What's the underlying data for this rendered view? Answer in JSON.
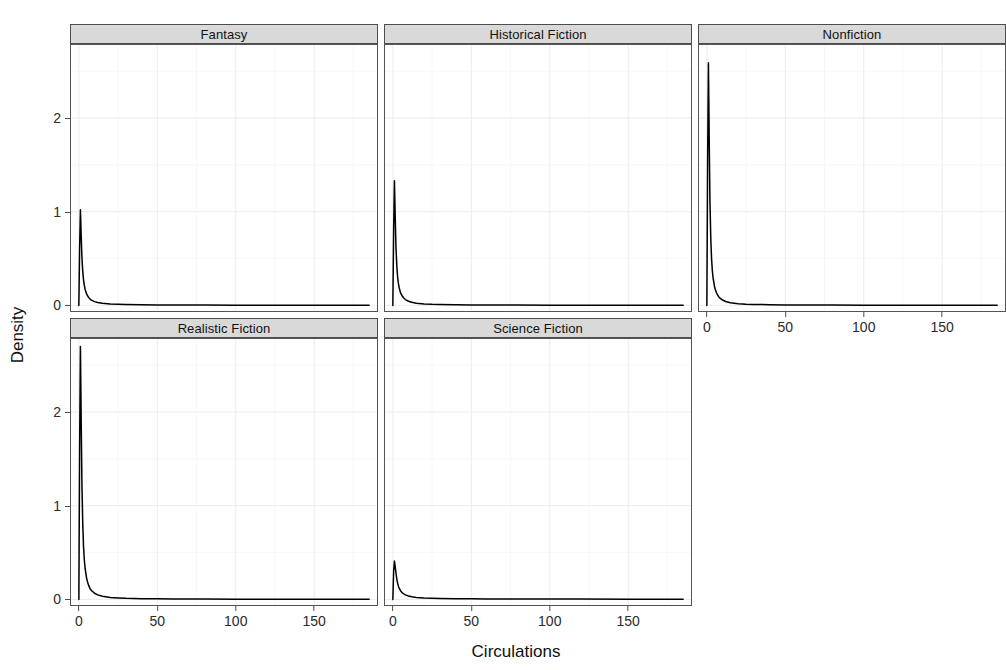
{
  "chart_data": {
    "type": "line",
    "title": "",
    "subtitle": "",
    "xlabel": "Circulations",
    "ylabel": "Density",
    "plot_kind": "faceted density plot",
    "facet_variable": "genre",
    "grid": true,
    "legend": "none",
    "xlim": [
      -5,
      190
    ],
    "ylim": [
      -0.06,
      2.78
    ],
    "x_ticks": [
      0,
      50,
      100,
      150
    ],
    "x_tick_labels": [
      "0",
      "50",
      "100",
      "150"
    ],
    "y_ticks": [
      0,
      1,
      2
    ],
    "y_tick_labels": [
      "0",
      "1",
      "2"
    ],
    "line_color": "#000000",
    "panel_background": "#ffffff",
    "strip_background": "#d9d9d9",
    "gridline_color": "#ebebeb",
    "panels": [
      {
        "label": "Fantasy",
        "row": 0,
        "col": 0,
        "peak_x": 1.0,
        "peak_density": 1.02,
        "x": [
          0,
          0.5,
          1,
          1.5,
          2,
          2.5,
          3,
          3.5,
          4,
          5,
          6,
          7,
          8,
          10,
          12,
          15,
          20,
          25,
          30,
          40,
          50,
          60,
          80,
          100,
          120,
          150,
          185
        ],
        "y": [
          0.0,
          0.62,
          1.02,
          0.74,
          0.5,
          0.36,
          0.27,
          0.21,
          0.17,
          0.12,
          0.09,
          0.07,
          0.056,
          0.04,
          0.03,
          0.022,
          0.014,
          0.011,
          0.009,
          0.007,
          0.005,
          0.004,
          0.003,
          0.002,
          0.002,
          0.001,
          0.001
        ]
      },
      {
        "label": "Historical Fiction",
        "row": 0,
        "col": 1,
        "peak_x": 1.0,
        "peak_density": 1.33,
        "x": [
          0,
          0.5,
          1,
          1.5,
          2,
          2.5,
          3,
          3.5,
          4,
          5,
          6,
          7,
          8,
          10,
          12,
          15,
          20,
          25,
          30,
          40,
          50,
          60,
          80,
          100,
          120,
          150,
          185
        ],
        "y": [
          0.0,
          0.8,
          1.33,
          0.95,
          0.62,
          0.43,
          0.31,
          0.24,
          0.19,
          0.13,
          0.1,
          0.078,
          0.062,
          0.044,
          0.033,
          0.023,
          0.015,
          0.011,
          0.009,
          0.007,
          0.005,
          0.004,
          0.003,
          0.002,
          0.002,
          0.001,
          0.001
        ]
      },
      {
        "label": "Nonfiction",
        "row": 0,
        "col": 2,
        "peak_x": 1.0,
        "peak_density": 2.59,
        "x": [
          0,
          0.5,
          1,
          1.5,
          2,
          2.5,
          3,
          3.5,
          4,
          5,
          6,
          7,
          8,
          10,
          12,
          15,
          20,
          25,
          30,
          40,
          50,
          60,
          80,
          100,
          120,
          150,
          185
        ],
        "y": [
          0.0,
          1.55,
          2.59,
          1.78,
          1.1,
          0.72,
          0.5,
          0.37,
          0.29,
          0.19,
          0.14,
          0.105,
          0.083,
          0.057,
          0.042,
          0.029,
          0.018,
          0.013,
          0.01,
          0.007,
          0.005,
          0.004,
          0.003,
          0.002,
          0.002,
          0.001,
          0.001
        ]
      },
      {
        "label": "Realistic Fiction",
        "row": 1,
        "col": 0,
        "peak_x": 1.0,
        "peak_density": 2.7,
        "x": [
          0,
          0.5,
          1,
          1.5,
          2,
          2.5,
          3,
          3.5,
          4,
          5,
          6,
          7,
          8,
          10,
          12,
          15,
          20,
          25,
          30,
          40,
          50,
          60,
          80,
          100,
          120,
          150,
          185
        ],
        "y": [
          0.0,
          1.62,
          2.7,
          1.9,
          1.2,
          0.8,
          0.56,
          0.42,
          0.33,
          0.22,
          0.16,
          0.12,
          0.095,
          0.065,
          0.048,
          0.033,
          0.02,
          0.015,
          0.011,
          0.008,
          0.006,
          0.004,
          0.003,
          0.002,
          0.002,
          0.001,
          0.001
        ]
      },
      {
        "label": "Science Fiction",
        "row": 1,
        "col": 1,
        "peak_x": 1.0,
        "peak_density": 0.41,
        "x": [
          0,
          0.5,
          1,
          1.5,
          2,
          2.5,
          3,
          3.5,
          4,
          5,
          6,
          7,
          8,
          10,
          12,
          15,
          20,
          25,
          30,
          40,
          50,
          60,
          80,
          100,
          120,
          150,
          185
        ],
        "y": [
          0.0,
          0.3,
          0.41,
          0.35,
          0.28,
          0.22,
          0.175,
          0.145,
          0.12,
          0.09,
          0.07,
          0.058,
          0.048,
          0.036,
          0.028,
          0.021,
          0.015,
          0.012,
          0.01,
          0.008,
          0.006,
          0.005,
          0.004,
          0.003,
          0.003,
          0.002,
          0.002
        ]
      }
    ]
  },
  "axes": {
    "y_title": "Density",
    "x_title": "Circulations"
  }
}
